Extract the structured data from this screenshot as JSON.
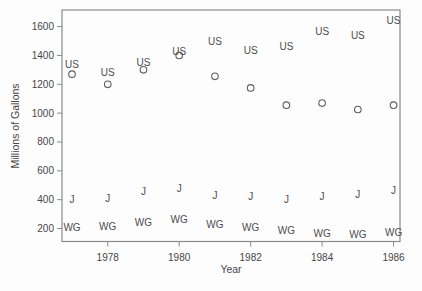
{
  "chart_data": {
    "type": "scatter",
    "title": "",
    "xlabel": "Year",
    "ylabel": "Millions of Gallons",
    "x": [
      1977,
      1978,
      1979,
      1980,
      1981,
      1982,
      1983,
      1984,
      1985,
      1986
    ],
    "x_ticks": [
      1978,
      1980,
      1982,
      1984,
      1986
    ],
    "y_ticks": [
      200,
      400,
      600,
      800,
      1000,
      1200,
      1400,
      1600
    ],
    "xlim": [
      1976.72,
      1986.18
    ],
    "ylim": [
      110,
      1715
    ],
    "grid": false,
    "legend_position": "none",
    "series": [
      {
        "label": "US",
        "marker": "text",
        "values": [
          1335,
          1280,
          1350,
          1425,
          1500,
          1435,
          1460,
          1565,
          1540,
          1640
        ]
      },
      {
        "label": "O",
        "marker": "circle",
        "values": [
          1270,
          1200,
          1300,
          1400,
          1255,
          1175,
          1055,
          1070,
          1025,
          1055
        ]
      },
      {
        "label": "J",
        "marker": "text",
        "values": [
          400,
          405,
          455,
          480,
          430,
          420,
          400,
          420,
          435,
          465
        ]
      },
      {
        "label": "WG",
        "marker": "text",
        "values": [
          210,
          215,
          240,
          260,
          230,
          210,
          185,
          165,
          160,
          175
        ]
      }
    ]
  },
  "colors": {
    "background": "#fdfdfd",
    "frame": "#8b8b8b",
    "text": "#474747",
    "marker": "#5d5d5d"
  }
}
